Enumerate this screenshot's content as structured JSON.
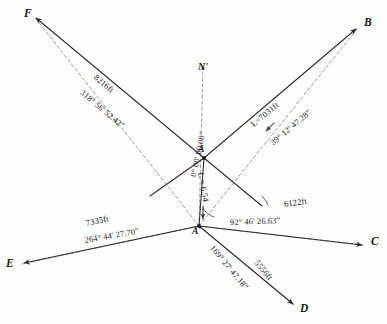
{
  "figure": {
    "north_marker": {
      "label": "N'",
      "name": "north-arrow"
    },
    "stations": [
      {
        "id": "F",
        "label": "F",
        "x": 32,
        "y": 16
      },
      {
        "id": "B",
        "label": "B",
        "x": 360,
        "y": 26
      },
      {
        "id": "E",
        "label": "E",
        "x": 16,
        "y": 266
      },
      {
        "id": "C",
        "label": "C",
        "x": 368,
        "y": 243
      },
      {
        "id": "D",
        "label": "D",
        "x": 297,
        "y": 309
      },
      {
        "id": "A",
        "label": "A",
        "x": 204,
        "y": 158
      },
      {
        "id": "A'",
        "label": "A'",
        "x": 199,
        "y": 226
      }
    ],
    "legs": [
      {
        "to": "F",
        "distance": "8216ft",
        "bearing": "318° 56' 52.42”",
        "from": "A"
      },
      {
        "to": "B",
        "distance": "L=7031ft",
        "bearing": "39° 12' 47.28”",
        "from": "A"
      },
      {
        "to": "C",
        "distance": "6122ft",
        "bearing": "92° 46' 26.63”",
        "from": "A'"
      },
      {
        "to": "D",
        "distance": "5556ft",
        "bearing": "169° 27' 47.18”",
        "from": "A'"
      },
      {
        "to": "E",
        "distance": "7335ft",
        "bearing": "264° 44' 27.70”",
        "from": "A'"
      }
    ],
    "center_annotations": {
      "zero_bearing": "0° 00' 00.00”",
      "short_leg": "L = 6.54"
    },
    "colors": {
      "solid_ray": "#2b2b2b",
      "dashed_ray": "#8d8d8d",
      "text": "#1a1a1a",
      "background": "#ffffff"
    }
  }
}
